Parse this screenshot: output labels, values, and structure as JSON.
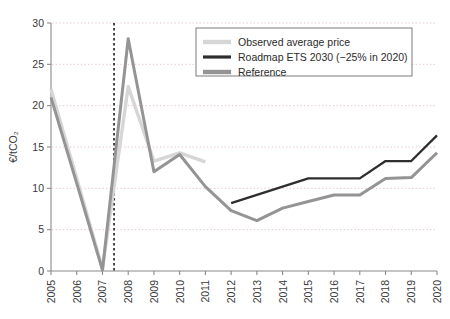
{
  "chart_data": {
    "type": "line",
    "title": "",
    "subtitle": "",
    "xlabel": "",
    "ylabel": "€/tCO₂",
    "categories": [
      2005,
      2006,
      2007,
      2008,
      2009,
      2010,
      2011,
      2012,
      2013,
      2014,
      2015,
      2016,
      2017,
      2018,
      2019,
      2020
    ],
    "x_tick_labels": [
      "2005",
      "2006",
      "2007",
      "2008",
      "2009",
      "2010",
      "2011",
      "2012",
      "2013",
      "2014",
      "2015",
      "2016",
      "2017",
      "2018",
      "2019",
      "2020"
    ],
    "y_tick_labels": [
      "0",
      "5",
      "10",
      "15",
      "20",
      "25",
      "30"
    ],
    "y_ticks": [
      0,
      5,
      10,
      15,
      20,
      25,
      30
    ],
    "ylim": [
      0,
      30
    ],
    "xlim": [
      2005,
      2020
    ],
    "grid": true,
    "grid_axis": "y",
    "legend_position": "top-right",
    "annotations": [
      {
        "name": "vertical-divider",
        "type": "vline",
        "x": 2007.45,
        "style": "dashed",
        "color": "#1f1f1f"
      }
    ],
    "series": [
      {
        "name": "Observed average price",
        "color": "#d6d6d6",
        "width": 3.4,
        "x": [
          2005,
          2006,
          2007,
          2008,
          2009,
          2010,
          2011
        ],
        "values": [
          22.0,
          11.2,
          0.3,
          22.3,
          13.3,
          14.3,
          13.2
        ]
      },
      {
        "name": "Roadmap ETS 2030 (−25% in 2020)",
        "color": "#2e2e2e",
        "width": 2.3,
        "x": [
          2012,
          2013,
          2014,
          2015,
          2016,
          2017,
          2018,
          2019,
          2020
        ],
        "values": [
          8.2,
          9.2,
          10.2,
          11.2,
          11.2,
          11.2,
          13.3,
          13.3,
          16.4
        ]
      },
      {
        "name": "Reference",
        "color": "#949494",
        "width": 3.0,
        "x": [
          2005,
          2006,
          2007,
          2008,
          2009,
          2010,
          2011,
          2012,
          2013,
          2014,
          2015,
          2016,
          2017,
          2018,
          2019,
          2020
        ],
        "values": [
          21.0,
          10.6,
          0.1,
          28.1,
          12.0,
          14.1,
          10.2,
          7.3,
          6.1,
          7.6,
          8.4,
          9.2,
          9.2,
          11.2,
          11.3,
          14.3
        ]
      }
    ]
  },
  "legend": {
    "items": [
      {
        "label": "Observed average price",
        "color": "#d6d6d6"
      },
      {
        "label": "Roadmap ETS 2030 (−25% in 2020)",
        "color": "#2e2e2e"
      },
      {
        "label": "Reference",
        "color": "#949494"
      }
    ]
  },
  "axes": {
    "y_title": "€/tCO₂"
  }
}
